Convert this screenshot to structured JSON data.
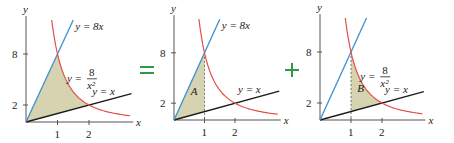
{
  "figure": {
    "colors": {
      "line_8x": "#3b8fd0",
      "curve": "#e0504a",
      "line_x": "#1a1a1a",
      "fill": "#d6d3b0",
      "operator": "#2e9a4a",
      "axis": "#555555"
    },
    "operators": [
      {
        "symbol": "=",
        "x": 147,
        "y": 70
      },
      {
        "symbol": "+",
        "x": 292,
        "y": 70
      }
    ],
    "labels": {
      "y_axis": "y",
      "x_axis": "x",
      "line_8x": "y = 8x",
      "curve_num": "8",
      "curve_den": "x²",
      "curve_prefix": "y =",
      "line_x": "y = x",
      "region_A": "A",
      "region_B": "B"
    },
    "ticks": {
      "x": [
        "1",
        "2"
      ],
      "y": [
        "2",
        "8"
      ]
    },
    "panels": [
      {
        "name": "full-region",
        "origin": [
          26,
          122
        ],
        "ux": 31.5,
        "uy": 8.5,
        "x_max": 3.4,
        "y_top": 12,
        "shade": "full",
        "show_8x_label": true,
        "show_curve_label": true,
        "show_x_label": true,
        "region_label": ""
      },
      {
        "name": "region-A",
        "origin": [
          174,
          120
        ],
        "ux": 30.5,
        "uy": 8.4,
        "x_max": 3.5,
        "y_top": 12,
        "shade": "A",
        "show_8x_label": true,
        "show_curve_label": false,
        "show_x_label": true,
        "region_label": "A"
      },
      {
        "name": "region-B",
        "origin": [
          320,
          120
        ],
        "ux": 31,
        "uy": 8.5,
        "x_max": 3.4,
        "y_top": 12,
        "shade": "B",
        "show_8x_label": false,
        "show_curve_label": true,
        "show_x_label": true,
        "region_label": "B"
      }
    ]
  }
}
